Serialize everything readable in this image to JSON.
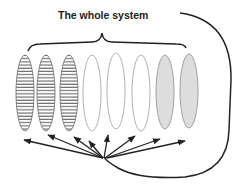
{
  "title": "The whole system",
  "elements": [
    {
      "id": 1,
      "fill": "hatched"
    },
    {
      "id": 2,
      "fill": "hatched"
    },
    {
      "id": 3,
      "fill": "hatched"
    },
    {
      "id": 4,
      "fill": "empty"
    },
    {
      "id": 5,
      "fill": "empty"
    },
    {
      "id": 6,
      "fill": "empty"
    },
    {
      "id": 7,
      "fill": "shaded"
    },
    {
      "id": 8,
      "fill": "shaded"
    }
  ],
  "colors": {
    "stroke": "#222222",
    "empty_stroke": "#aaaaaa",
    "shaded": "#dddddd",
    "hatch": "#555555"
  }
}
